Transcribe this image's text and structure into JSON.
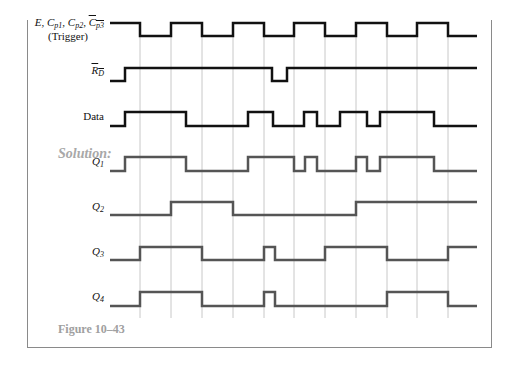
{
  "figure": {
    "solution_label": "Solution:",
    "caption": "Figure 10–43"
  },
  "signals": {
    "trigger": {
      "label_main": "E, C",
      "label_full": "E, Cp1, Cp2, Cp3 (overbar)",
      "label_line2": "(Trigger)",
      "sub1": "p1",
      "sub2": "p2",
      "sub3": "p3"
    },
    "rd": {
      "label": "R",
      "sub": "D"
    },
    "data": {
      "label": "Data"
    },
    "q1": {
      "label": "Q",
      "sub": "1"
    },
    "q2": {
      "label": "Q",
      "sub": "2"
    },
    "q3": {
      "label": "Q",
      "sub": "3"
    },
    "q4": {
      "label": "Q",
      "sub": "4"
    }
  },
  "chart_data": {
    "type": "timing-diagram",
    "title": "Figure 10–43",
    "x_range": [
      110,
      477
    ],
    "clock_gridlines_x": [
      140,
      171,
      202,
      233,
      264,
      294,
      325,
      356,
      387,
      417,
      448
    ],
    "series": [
      {
        "name": "E, Cp1, Cp2, /Cp3 (Trigger)",
        "y_high": 23,
        "y_low": 36,
        "initial": 1,
        "transitions": [
          140,
          171,
          202,
          233,
          264,
          294,
          325,
          356,
          387,
          417,
          448
        ],
        "color": "#111111"
      },
      {
        "name": "/R_D",
        "y_high": 68,
        "y_low": 81,
        "initial": 0,
        "transitions": [
          125,
          272,
          287
        ],
        "color": "#111111"
      },
      {
        "name": "Data",
        "y_high": 112,
        "y_low": 126,
        "initial": 0,
        "transitions": [
          125,
          186,
          248,
          273,
          304,
          317,
          340,
          367,
          380,
          434
        ],
        "color": "#111111"
      },
      {
        "name": "Q1",
        "y_high": 157,
        "y_low": 171,
        "initial": 0,
        "transitions": [
          125,
          186,
          248,
          294,
          305,
          317,
          356,
          367,
          380,
          434
        ],
        "color": "#555555"
      },
      {
        "name": "Q2",
        "y_high": 202,
        "y_low": 215,
        "initial": 0,
        "transitions": [
          171,
          233,
          356
        ],
        "color": "#555555"
      },
      {
        "name": "Q3",
        "y_high": 247,
        "y_low": 260,
        "initial": 0,
        "transitions": [
          140,
          202,
          264,
          275,
          325,
          387,
          448
        ],
        "color": "#555555"
      },
      {
        "name": "Q4",
        "y_high": 292,
        "y_low": 306,
        "initial": 0,
        "transitions": [
          140,
          202,
          264,
          275,
          387,
          448
        ],
        "color": "#555555"
      }
    ]
  }
}
